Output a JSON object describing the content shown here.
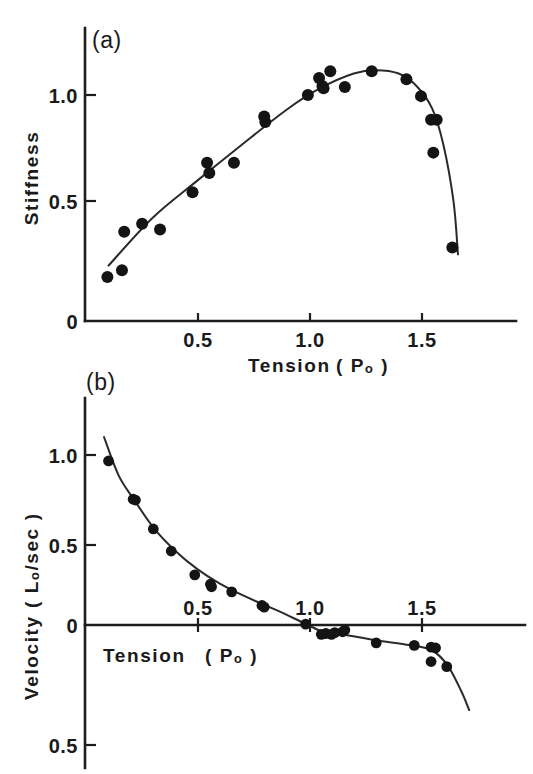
{
  "figure": {
    "background_color": "#ffffff",
    "ink_color": "#1a1a1a",
    "width": 533,
    "height": 774
  },
  "panels": [
    {
      "id": "panel-a",
      "label": "(a)",
      "chart_index": 0
    },
    {
      "id": "panel-b",
      "label": "(b)",
      "chart_index": 1
    }
  ],
  "chart_data": [
    {
      "type": "scatter",
      "panel": "(a)",
      "title": "",
      "xlabel": "Tension  ( Pₒ )",
      "xlabel_main": "Tension",
      "xlabel_unit": "( Pₒ )",
      "ylabel": "Stiffness",
      "xlim": [
        0,
        1.9
      ],
      "ylim": [
        0,
        1.27
      ],
      "xticks": [
        0.5,
        1.0,
        1.5
      ],
      "xticklabels": [
        "0.5",
        "1.0",
        "1.5"
      ],
      "yticks": [
        0,
        0.5,
        1.0
      ],
      "yticklabels": [
        "0",
        "0.5",
        "1.0"
      ],
      "grid": false,
      "legend": "none",
      "marker": "filled-circle",
      "points": [
        {
          "x": 0.1,
          "y": 0.195
        },
        {
          "x": 0.165,
          "y": 0.225
        },
        {
          "x": 0.175,
          "y": 0.395
        },
        {
          "x": 0.255,
          "y": 0.43
        },
        {
          "x": 0.335,
          "y": 0.405
        },
        {
          "x": 0.48,
          "y": 0.57
        },
        {
          "x": 0.545,
          "y": 0.7
        },
        {
          "x": 0.555,
          "y": 0.655
        },
        {
          "x": 0.665,
          "y": 0.7
        },
        {
          "x": 0.8,
          "y": 0.905
        },
        {
          "x": 0.805,
          "y": 0.88
        },
        {
          "x": 0.995,
          "y": 1.0
        },
        {
          "x": 1.045,
          "y": 1.075
        },
        {
          "x": 1.06,
          "y": 1.04
        },
        {
          "x": 1.065,
          "y": 1.03
        },
        {
          "x": 1.095,
          "y": 1.105
        },
        {
          "x": 1.16,
          "y": 1.035
        },
        {
          "x": 1.28,
          "y": 1.105
        },
        {
          "x": 1.435,
          "y": 1.07
        },
        {
          "x": 1.5,
          "y": 0.995
        },
        {
          "x": 1.545,
          "y": 0.89
        },
        {
          "x": 1.57,
          "y": 0.89
        },
        {
          "x": 1.555,
          "y": 0.745
        },
        {
          "x": 1.64,
          "y": 0.325
        }
      ],
      "curve": [
        {
          "x": 0.105,
          "y": 0.245
        },
        {
          "x": 0.3,
          "y": 0.455
        },
        {
          "x": 0.5,
          "y": 0.62
        },
        {
          "x": 0.7,
          "y": 0.78
        },
        {
          "x": 0.9,
          "y": 0.935
        },
        {
          "x": 1.05,
          "y": 1.03
        },
        {
          "x": 1.2,
          "y": 1.095
        },
        {
          "x": 1.3,
          "y": 1.11
        },
        {
          "x": 1.4,
          "y": 1.095
        },
        {
          "x": 1.48,
          "y": 1.04
        },
        {
          "x": 1.55,
          "y": 0.94
        },
        {
          "x": 1.6,
          "y": 0.78
        },
        {
          "x": 1.645,
          "y": 0.53
        },
        {
          "x": 1.665,
          "y": 0.295
        }
      ]
    },
    {
      "type": "scatter",
      "panel": "(b)",
      "title": "",
      "xlabel": "Tension  ( Pₒ )",
      "xlabel_main": "Tension",
      "xlabel_unit": "( Pₒ )",
      "ylabel": "Velocity  ( Lₒ/sec )",
      "ylabel_main": "Velocity",
      "ylabel_unit": "( Lₒ/sec )",
      "xlim": [
        0,
        1.9
      ],
      "ylim": [
        -0.62,
        1.22
      ],
      "xticks": [
        0.5,
        1.0,
        1.5
      ],
      "xticklabels": [
        "0.5",
        "1.0",
        "1.5"
      ],
      "yticks": [
        1.0,
        0.5,
        0,
        -0.5
      ],
      "yticklabels": [
        "1.0",
        "0.5",
        "0",
        "0.5"
      ],
      "grid": false,
      "legend": "none",
      "marker": "filled-circle",
      "points": [
        {
          "x": 0.105,
          "y": 0.965
        },
        {
          "x": 0.215,
          "y": 0.74
        },
        {
          "x": 0.225,
          "y": 0.735
        },
        {
          "x": 0.305,
          "y": 0.565
        },
        {
          "x": 0.385,
          "y": 0.435
        },
        {
          "x": 0.49,
          "y": 0.295
        },
        {
          "x": 0.56,
          "y": 0.24
        },
        {
          "x": 0.565,
          "y": 0.225
        },
        {
          "x": 0.655,
          "y": 0.195
        },
        {
          "x": 0.79,
          "y": 0.115
        },
        {
          "x": 0.8,
          "y": 0.105
        },
        {
          "x": 0.985,
          "y": 0.005
        },
        {
          "x": 1.055,
          "y": -0.055
        },
        {
          "x": 1.075,
          "y": -0.05
        },
        {
          "x": 1.1,
          "y": -0.055
        },
        {
          "x": 1.115,
          "y": -0.045
        },
        {
          "x": 1.15,
          "y": -0.04
        },
        {
          "x": 1.16,
          "y": -0.03
        },
        {
          "x": 1.3,
          "y": -0.105
        },
        {
          "x": 1.47,
          "y": -0.12
        },
        {
          "x": 1.545,
          "y": -0.13
        },
        {
          "x": 1.565,
          "y": -0.135
        },
        {
          "x": 1.545,
          "y": -0.215
        },
        {
          "x": 1.615,
          "y": -0.245
        }
      ],
      "curve": [
        {
          "x": 0.085,
          "y": 1.105
        },
        {
          "x": 0.15,
          "y": 0.88
        },
        {
          "x": 0.22,
          "y": 0.735
        },
        {
          "x": 0.31,
          "y": 0.565
        },
        {
          "x": 0.4,
          "y": 0.44
        },
        {
          "x": 0.5,
          "y": 0.33
        },
        {
          "x": 0.6,
          "y": 0.245
        },
        {
          "x": 0.72,
          "y": 0.165
        },
        {
          "x": 0.85,
          "y": 0.09
        },
        {
          "x": 0.98,
          "y": 0.01
        },
        {
          "x": 1.06,
          "y": -0.038
        },
        {
          "x": 1.16,
          "y": -0.058
        },
        {
          "x": 1.3,
          "y": -0.09
        },
        {
          "x": 1.45,
          "y": -0.118
        },
        {
          "x": 1.55,
          "y": -0.15
        },
        {
          "x": 1.62,
          "y": -0.24
        },
        {
          "x": 1.68,
          "y": -0.39
        },
        {
          "x": 1.715,
          "y": -0.5
        }
      ]
    }
  ]
}
